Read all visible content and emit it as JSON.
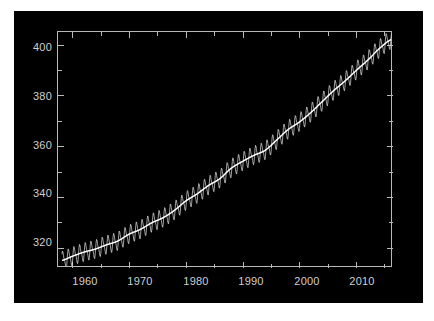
{
  "figure": {
    "background_color": "#000000",
    "page_background_color": "#ffffff",
    "axis_color": "#b9b9b9",
    "tick_label_color": "#cfcfcf",
    "series_color": "#f2f2f2",
    "trend_color": "#ffffff"
  },
  "chart_data": {
    "type": "line",
    "title": "",
    "subtitle": "",
    "xlabel": "",
    "ylabel": "",
    "xlim": [
      1957.5,
      2016.5
    ],
    "ylim": [
      312.0,
      405.0
    ],
    "grid": false,
    "legend": null,
    "xticks": [
      1960,
      1965,
      1970,
      1975,
      1980,
      1985,
      1990,
      1995,
      2000,
      2005,
      2010,
      2015
    ],
    "xtick_labels": [
      "1960",
      "",
      "1970",
      "",
      "1980",
      "",
      "1990",
      "",
      "2000",
      "",
      "2010",
      ""
    ],
    "xtick_major_labels": [
      "1960",
      "1970",
      "1980",
      "1990",
      "2000",
      "2010"
    ],
    "yticks": [
      320,
      330,
      340,
      350,
      360,
      370,
      380,
      390,
      400
    ],
    "ytick_labels": [
      "320",
      "",
      "340",
      "",
      "360",
      "",
      "380",
      "",
      "400"
    ],
    "ytick_major_labels": [
      "320",
      "340",
      "360",
      "380",
      "400"
    ],
    "series": [
      {
        "name": "Monthly mean CO2 (ppm)",
        "x": [
          1958.2,
          1958.5,
          1958.8,
          1959.0,
          1959.2,
          1959.5,
          1959.8,
          1960.0,
          1960.2,
          1960.5,
          1960.8,
          1961.0,
          1961.2,
          1961.5,
          1961.8,
          1962.0,
          1962.2,
          1962.5,
          1962.8,
          1963.0,
          1963.2,
          1963.5,
          1963.8,
          1964.0,
          1964.2,
          1964.5,
          1964.8,
          1965.0,
          1965.2,
          1965.5,
          1965.8,
          1966.0,
          1966.2,
          1966.5,
          1966.8,
          1967.0,
          1967.2,
          1967.5,
          1967.8,
          1968.0,
          1968.2,
          1968.5,
          1968.8,
          1969.0,
          1969.2,
          1969.5,
          1969.8,
          1970.0,
          1970.2,
          1970.5,
          1970.8,
          1971.0,
          1971.2,
          1971.5,
          1971.8,
          1972.0,
          1972.2,
          1972.5,
          1972.8,
          1973.0,
          1973.2,
          1973.5,
          1973.8,
          1974.0,
          1974.2,
          1974.5,
          1974.8,
          1975.0,
          1975.2,
          1975.5,
          1975.8,
          1976.0,
          1976.2,
          1976.5,
          1976.8,
          1977.0,
          1977.2,
          1977.5,
          1977.8,
          1978.0,
          1978.2,
          1978.5,
          1978.8,
          1979.0,
          1979.2,
          1979.5,
          1979.8,
          1980.0,
          1980.2,
          1980.5,
          1980.8,
          1981.0,
          1981.2,
          1981.5,
          1981.8,
          1982.0,
          1982.2,
          1982.5,
          1982.8,
          1983.0,
          1983.2,
          1983.5,
          1983.8,
          1984.0,
          1984.2,
          1984.5,
          1984.8,
          1985.0,
          1985.2,
          1985.5,
          1985.8,
          1986.0,
          1986.2,
          1986.5,
          1986.8,
          1987.0,
          1987.2,
          1987.5,
          1987.8,
          1988.0,
          1988.2,
          1988.5,
          1988.8,
          1989.0,
          1989.2,
          1989.5,
          1989.8,
          1990.0,
          1990.2,
          1990.5,
          1990.8,
          1991.0,
          1991.2,
          1991.5,
          1991.8,
          1992.0,
          1992.2,
          1992.5,
          1992.8,
          1993.0,
          1993.2,
          1993.5,
          1993.8,
          1994.0,
          1994.2,
          1994.5,
          1994.8,
          1995.0,
          1995.2,
          1995.5,
          1995.8,
          1996.0,
          1996.2,
          1996.5,
          1996.8,
          1997.0,
          1997.2,
          1997.5,
          1997.8,
          1998.0,
          1998.2,
          1998.5,
          1998.8,
          1999.0,
          1999.2,
          1999.5,
          1999.8,
          2000.0,
          2000.2,
          2000.5,
          2000.8,
          2001.0,
          2001.2,
          2001.5,
          2001.8,
          2002.0,
          2002.2,
          2002.5,
          2002.8,
          2003.0,
          2003.2,
          2003.5,
          2003.8,
          2004.0,
          2004.2,
          2004.5,
          2004.8,
          2005.0,
          2005.2,
          2005.5,
          2005.8,
          2006.0,
          2006.2,
          2006.5,
          2006.8,
          2007.0,
          2007.2,
          2007.5,
          2007.8,
          2008.0,
          2008.2,
          2008.5,
          2008.8,
          2009.0,
          2009.2,
          2009.5,
          2009.8,
          2010.0,
          2010.2,
          2010.5,
          2010.8,
          2011.0,
          2011.2,
          2011.5,
          2011.8,
          2012.0,
          2012.2,
          2012.5,
          2012.8,
          2013.0,
          2013.2,
          2013.5,
          2013.8,
          2014.0,
          2014.2,
          2014.5,
          2014.8,
          2015.0,
          2015.2,
          2015.5,
          2015.8,
          2016.0,
          2016.2
        ],
        "description": "Mauna Loa monthly mean atmospheric CO2 with seasonal sawtooth"
      },
      {
        "name": "Seasonally adjusted trend (ppm)",
        "anchors_x": [
          1958.2,
          1960,
          1962,
          1964,
          1966,
          1968,
          1970,
          1972,
          1974,
          1976,
          1978,
          1980,
          1982,
          1984,
          1986,
          1988,
          1990,
          1992,
          1994,
          1996,
          1998,
          2000,
          2002,
          2004,
          2006,
          2008,
          2010,
          2012,
          2014,
          2016.2
        ],
        "anchors_y": [
          315.0,
          316.6,
          318.2,
          319.4,
          321.1,
          322.6,
          325.3,
          327.2,
          329.8,
          331.8,
          334.7,
          338.4,
          341.2,
          344.5,
          347.2,
          351.3,
          354.0,
          356.4,
          358.4,
          362.4,
          366.5,
          369.5,
          373.2,
          377.5,
          381.8,
          385.6,
          389.8,
          393.8,
          398.3,
          402.0
        ],
        "description": "Smoothed long-term rising trend line"
      }
    ],
    "seasonal_amplitude_ppm": 3.2,
    "source_note": ""
  }
}
